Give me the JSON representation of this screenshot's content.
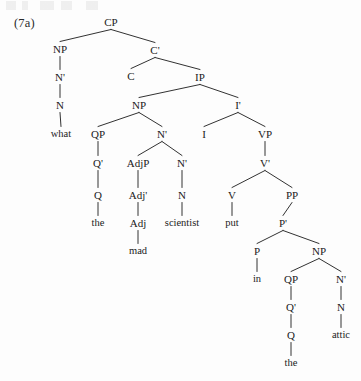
{
  "figure": {
    "example_label": "(7a)",
    "sentence": "what the mad scientist put in the attic",
    "diagram_type": "syntax-tree",
    "width": 361,
    "height": 381,
    "ink_color": "#1b1b1b",
    "background_color": "#fdfdfd"
  },
  "nodes": [
    {
      "id": "cp",
      "label": "CP",
      "x": 111,
      "y": 22,
      "kind": "phrase"
    },
    {
      "id": "np1",
      "label": "NP",
      "x": 60,
      "y": 49,
      "kind": "phrase"
    },
    {
      "id": "cbar",
      "label": "C'",
      "x": 155,
      "y": 50,
      "kind": "bar"
    },
    {
      "id": "nbar1",
      "label": "N'",
      "x": 60,
      "y": 77,
      "kind": "bar"
    },
    {
      "id": "c",
      "label": "C",
      "x": 131,
      "y": 76,
      "kind": "head"
    },
    {
      "id": "ip",
      "label": "IP",
      "x": 200,
      "y": 77,
      "kind": "phrase"
    },
    {
      "id": "n1",
      "label": "N",
      "x": 60,
      "y": 105,
      "kind": "head"
    },
    {
      "id": "np2",
      "label": "NP",
      "x": 139,
      "y": 105,
      "kind": "phrase"
    },
    {
      "id": "ibar",
      "label": "I'",
      "x": 238,
      "y": 105,
      "kind": "bar"
    },
    {
      "id": "what",
      "label": "what",
      "x": 61,
      "y": 134,
      "kind": "terminal"
    },
    {
      "id": "qp1",
      "label": "QP",
      "x": 98,
      "y": 134,
      "kind": "phrase"
    },
    {
      "id": "nbar2",
      "label": "N'",
      "x": 162,
      "y": 134,
      "kind": "bar"
    },
    {
      "id": "i",
      "label": "I",
      "x": 204,
      "y": 134,
      "kind": "head"
    },
    {
      "id": "vp",
      "label": "VP",
      "x": 265,
      "y": 134,
      "kind": "phrase"
    },
    {
      "id": "qbar1",
      "label": "Q'",
      "x": 98,
      "y": 163,
      "kind": "bar"
    },
    {
      "id": "adjp",
      "label": "AdjP",
      "x": 138,
      "y": 163,
      "kind": "phrase"
    },
    {
      "id": "nbar3",
      "label": "N'",
      "x": 182,
      "y": 163,
      "kind": "bar"
    },
    {
      "id": "vbar",
      "label": "V'",
      "x": 265,
      "y": 163,
      "kind": "bar"
    },
    {
      "id": "q1",
      "label": "Q",
      "x": 98,
      "y": 195,
      "kind": "head"
    },
    {
      "id": "adjbar",
      "label": "Adj'",
      "x": 138,
      "y": 195,
      "kind": "bar"
    },
    {
      "id": "n2",
      "label": "N",
      "x": 182,
      "y": 195,
      "kind": "head"
    },
    {
      "id": "v",
      "label": "V",
      "x": 232,
      "y": 195,
      "kind": "head"
    },
    {
      "id": "pp",
      "label": "PP",
      "x": 292,
      "y": 195,
      "kind": "phrase"
    },
    {
      "id": "the1",
      "label": "the",
      "x": 98,
      "y": 223,
      "kind": "terminal"
    },
    {
      "id": "adj",
      "label": "Adj",
      "x": 138,
      "y": 223,
      "kind": "head"
    },
    {
      "id": "scientist",
      "label": "scientist",
      "x": 182,
      "y": 223,
      "kind": "terminal"
    },
    {
      "id": "put",
      "label": "put",
      "x": 232,
      "y": 223,
      "kind": "terminal"
    },
    {
      "id": "pbar",
      "label": "P'",
      "x": 283,
      "y": 223,
      "kind": "bar"
    },
    {
      "id": "mad",
      "label": "mad",
      "x": 138,
      "y": 251,
      "kind": "terminal"
    },
    {
      "id": "p",
      "label": "P",
      "x": 257,
      "y": 251,
      "kind": "head"
    },
    {
      "id": "np3",
      "label": "NP",
      "x": 319,
      "y": 251,
      "kind": "phrase"
    },
    {
      "id": "in",
      "label": "in",
      "x": 257,
      "y": 279,
      "kind": "terminal"
    },
    {
      "id": "qp2",
      "label": "QP",
      "x": 291,
      "y": 279,
      "kind": "phrase"
    },
    {
      "id": "nbar4",
      "label": "N'",
      "x": 341,
      "y": 279,
      "kind": "bar"
    },
    {
      "id": "qbar2",
      "label": "Q'",
      "x": 291,
      "y": 307,
      "kind": "bar"
    },
    {
      "id": "n3",
      "label": "N",
      "x": 341,
      "y": 307,
      "kind": "head"
    },
    {
      "id": "q2",
      "label": "Q",
      "x": 291,
      "y": 335,
      "kind": "head"
    },
    {
      "id": "attic",
      "label": "attic",
      "x": 341,
      "y": 335,
      "kind": "terminal"
    },
    {
      "id": "the2",
      "label": "the",
      "x": 291,
      "y": 363,
      "kind": "terminal"
    }
  ],
  "edges": [
    {
      "from": "cp",
      "to": "np1"
    },
    {
      "from": "cp",
      "to": "cbar"
    },
    {
      "from": "np1",
      "to": "nbar1"
    },
    {
      "from": "nbar1",
      "to": "n1"
    },
    {
      "from": "n1",
      "to": "what"
    },
    {
      "from": "cbar",
      "to": "c"
    },
    {
      "from": "cbar",
      "to": "ip"
    },
    {
      "from": "ip",
      "to": "np2"
    },
    {
      "from": "ip",
      "to": "ibar"
    },
    {
      "from": "np2",
      "to": "qp1"
    },
    {
      "from": "np2",
      "to": "nbar2"
    },
    {
      "from": "qp1",
      "to": "qbar1"
    },
    {
      "from": "qbar1",
      "to": "q1"
    },
    {
      "from": "q1",
      "to": "the1"
    },
    {
      "from": "nbar2",
      "to": "adjp"
    },
    {
      "from": "nbar2",
      "to": "nbar3"
    },
    {
      "from": "adjp",
      "to": "adjbar"
    },
    {
      "from": "adjbar",
      "to": "adj"
    },
    {
      "from": "adj",
      "to": "mad"
    },
    {
      "from": "nbar3",
      "to": "n2"
    },
    {
      "from": "n2",
      "to": "scientist"
    },
    {
      "from": "ibar",
      "to": "i"
    },
    {
      "from": "ibar",
      "to": "vp"
    },
    {
      "from": "vp",
      "to": "vbar"
    },
    {
      "from": "vbar",
      "to": "v"
    },
    {
      "from": "vbar",
      "to": "pp"
    },
    {
      "from": "v",
      "to": "put"
    },
    {
      "from": "pp",
      "to": "pbar"
    },
    {
      "from": "pbar",
      "to": "p"
    },
    {
      "from": "pbar",
      "to": "np3"
    },
    {
      "from": "p",
      "to": "in"
    },
    {
      "from": "np3",
      "to": "qp2"
    },
    {
      "from": "np3",
      "to": "nbar4"
    },
    {
      "from": "qp2",
      "to": "qbar2"
    },
    {
      "from": "qbar2",
      "to": "q2"
    },
    {
      "from": "q2",
      "to": "the2"
    },
    {
      "from": "nbar4",
      "to": "n3"
    },
    {
      "from": "n3",
      "to": "attic"
    }
  ]
}
